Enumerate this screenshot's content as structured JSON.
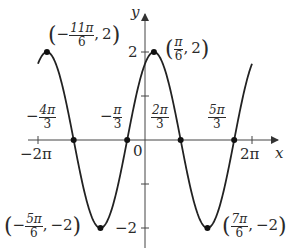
{
  "chart_data": {
    "type": "line",
    "title": "",
    "function": "y = 2 sin(x + π/3)",
    "xlabel": "x",
    "ylabel": "y",
    "xlim_pi": [
      -2,
      2
    ],
    "ylim": [
      -2,
      2
    ],
    "grid": false,
    "series": [
      {
        "name": "y = 2 sin(x + π/3)",
        "x_pi": [
          -2,
          -1.8333,
          -1.3333,
          -0.8333,
          -0.3333,
          0.1667,
          0.6667,
          1.1667,
          1.6667,
          2
        ],
        "y": [
          1.732,
          2,
          0,
          -2,
          0,
          2,
          0,
          -2,
          0,
          1.732
        ]
      }
    ],
    "x_ticks": [
      {
        "value_pi": -2,
        "label": "−2π"
      },
      {
        "value_pi": 0,
        "label": "0"
      },
      {
        "value_pi": 2,
        "label": "2π"
      }
    ],
    "y_ticks": [
      {
        "value": 2,
        "label": "2"
      },
      {
        "value": 1,
        "label": ""
      },
      {
        "value": -1,
        "label": ""
      },
      {
        "value": -2,
        "label": "−2"
      }
    ],
    "zero_labels": [
      {
        "value_pi": -1.3333,
        "sign": "−",
        "num": "4π",
        "den": "3"
      },
      {
        "value_pi": -0.3333,
        "sign": "−",
        "num": "π",
        "den": "3"
      },
      {
        "value_pi": 0.6667,
        "sign": "",
        "num": "2π",
        "den": "3"
      },
      {
        "value_pi": 1.6667,
        "sign": "",
        "num": "5π",
        "den": "3"
      }
    ],
    "annotated_points": [
      {
        "x_pi": -1.8333,
        "y": 2,
        "sign": "−",
        "num": "11π",
        "den": "6",
        "yval": "2"
      },
      {
        "x_pi": 0.1667,
        "y": 2,
        "sign": "",
        "num": "π",
        "den": "6",
        "yval": "2"
      },
      {
        "x_pi": -0.8333,
        "y": -2,
        "sign": "−",
        "num": "5π",
        "den": "6",
        "yval": "−2"
      },
      {
        "x_pi": 1.1667,
        "y": -2,
        "sign": "",
        "num": "7π",
        "den": "6",
        "yval": "−2"
      }
    ]
  },
  "labels": {
    "y_axis": "y",
    "x_axis": "x",
    "origin": "0",
    "neg_two_pi": "−2π",
    "two_pi": "2π",
    "y_two": "2",
    "y_neg_two": "−2",
    "zero_neg_4pi_3": {
      "sign": "−",
      "num": "4π",
      "den": "3"
    },
    "zero_neg_pi_3": {
      "sign": "−",
      "num": "π",
      "den": "3"
    },
    "zero_2pi_3": {
      "num": "2π",
      "den": "3"
    },
    "zero_5pi_3": {
      "num": "5π",
      "den": "3"
    },
    "pt_neg_11pi_6": {
      "sign": "−",
      "num": "11π",
      "den": "6",
      "y": "2"
    },
    "pt_pi_6": {
      "num": "π",
      "den": "6",
      "y": "2"
    },
    "pt_neg_5pi_6": {
      "sign": "−",
      "num": "5π",
      "den": "6",
      "y": "−2"
    },
    "pt_7pi_6": {
      "num": "7π",
      "den": "6",
      "y": "−2"
    }
  }
}
